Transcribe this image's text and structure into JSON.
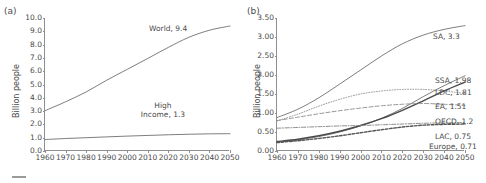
{
  "figure": {
    "width": 486,
    "height": 183,
    "background": "#ffffff",
    "line_color": "#6e6e6e",
    "axis_color": "#8f8f8f",
    "text_color": "#4a4a4a"
  },
  "chart_data": [
    {
      "type": "line",
      "panel_letter": "(a)",
      "title": "",
      "xlabel": "",
      "ylabel": "Billion people",
      "x": [
        1960,
        1970,
        1980,
        1990,
        2000,
        2010,
        2020,
        2030,
        2040,
        2050
      ],
      "xlim": [
        1960,
        2050
      ],
      "ylim": [
        0.0,
        10.0
      ],
      "xticks": [
        "1960",
        "1970",
        "1980",
        "1990",
        "2000",
        "2010",
        "2020",
        "2030",
        "2040",
        "2050"
      ],
      "yticks": [
        "0.0",
        "1.0",
        "2.0",
        "3.0",
        "4.0",
        "5.0",
        "6.0",
        "7.0",
        "8.0",
        "9.0",
        "10.0"
      ],
      "grid": false,
      "legend": "annotations",
      "series": [
        {
          "name": "World",
          "end_label": "World, 9.4",
          "end_value": 9.4,
          "style": "solid",
          "values": [
            3.03,
            3.7,
            4.44,
            5.32,
            6.14,
            6.96,
            7.79,
            8.55,
            9.08,
            9.4
          ]
        },
        {
          "name": "High Income",
          "end_label": "High\nIncome, 1.3",
          "end_value": 1.3,
          "style": "solid",
          "values": [
            0.86,
            0.94,
            1.0,
            1.06,
            1.12,
            1.17,
            1.22,
            1.26,
            1.29,
            1.3
          ]
        }
      ]
    },
    {
      "type": "line",
      "panel_letter": "(b)",
      "title": "",
      "xlabel": "",
      "ylabel": "Billion people",
      "x": [
        1960,
        1970,
        1980,
        1990,
        2000,
        2010,
        2020,
        2030,
        2040,
        2050
      ],
      "xlim": [
        1960,
        2050
      ],
      "ylim": [
        0.0,
        3.5
      ],
      "xticks": [
        "1960",
        "1970",
        "1980",
        "1990",
        "2000",
        "2010",
        "2020",
        "2030",
        "2040",
        "2050"
      ],
      "yticks": [
        "0.00",
        "0.50",
        "1.00",
        "1.50",
        "2.00",
        "2.50",
        "3.00",
        "3.50"
      ],
      "grid": false,
      "legend": "annotations",
      "series": [
        {
          "name": "SA",
          "end_label": "SA, 3.3",
          "end_value": 3.3,
          "style": "solid",
          "values": [
            0.88,
            1.1,
            1.4,
            1.76,
            2.13,
            2.5,
            2.82,
            3.05,
            3.2,
            3.3
          ]
        },
        {
          "name": "SSA",
          "end_label": "SSA, 1.98",
          "end_value": 1.98,
          "style": "solid",
          "values": [
            0.23,
            0.29,
            0.38,
            0.5,
            0.66,
            0.86,
            1.12,
            1.43,
            1.72,
            1.98
          ]
        },
        {
          "name": "LDC",
          "end_label": "LDC, 1.81",
          "end_value": 1.81,
          "style": "solid-dark",
          "values": [
            0.25,
            0.31,
            0.4,
            0.52,
            0.67,
            0.85,
            1.07,
            1.32,
            1.58,
            1.81
          ]
        },
        {
          "name": "EA",
          "end_label": "EA, 1.51",
          "end_value": 1.51,
          "style": "dotted",
          "values": [
            0.79,
            0.97,
            1.18,
            1.36,
            1.5,
            1.58,
            1.62,
            1.62,
            1.58,
            1.51
          ]
        },
        {
          "name": "OECD",
          "end_label": "OECD, 1.2",
          "end_value": 1.2,
          "style": "dashed",
          "values": [
            0.8,
            0.89,
            0.98,
            1.06,
            1.13,
            1.19,
            1.23,
            1.25,
            1.23,
            1.2
          ]
        },
        {
          "name": "LAC",
          "end_label": "LAC, 0.75",
          "end_value": 0.75,
          "style": "dash-dot",
          "values": [
            0.6,
            0.62,
            0.64,
            0.66,
            0.67,
            0.69,
            0.71,
            0.73,
            0.74,
            0.75
          ]
        },
        {
          "name": "Europe",
          "end_label": "Europe, 0.71",
          "end_value": 0.71,
          "style": "dashed-thick",
          "values": [
            0.22,
            0.27,
            0.33,
            0.4,
            0.48,
            0.56,
            0.63,
            0.68,
            0.7,
            0.71
          ]
        }
      ]
    }
  ]
}
